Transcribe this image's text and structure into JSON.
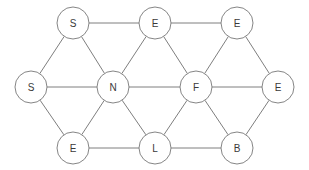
{
  "diagram": {
    "type": "graph",
    "canvas": {
      "width": 309,
      "height": 170
    },
    "style": {
      "background_color": "#ffffff",
      "node_fill": "#ffffff",
      "node_stroke": "#777777",
      "edge_stroke": "#6f6f6f",
      "label_color": "#3a3a3a",
      "node_radius": 16,
      "stroke_width": 0.9
    },
    "nodes": [
      {
        "id": "n0",
        "label": "S",
        "x": 73,
        "y": 23
      },
      {
        "id": "n1",
        "label": "E",
        "x": 155,
        "y": 23
      },
      {
        "id": "n2",
        "label": "E",
        "x": 237,
        "y": 23
      },
      {
        "id": "n3",
        "label": "S",
        "x": 31,
        "y": 87
      },
      {
        "id": "n4",
        "label": "N",
        "x": 113,
        "y": 87
      },
      {
        "id": "n5",
        "label": "F",
        "x": 196,
        "y": 87
      },
      {
        "id": "n6",
        "label": "E",
        "x": 278,
        "y": 87
      },
      {
        "id": "n7",
        "label": "E",
        "x": 73,
        "y": 148
      },
      {
        "id": "n8",
        "label": "L",
        "x": 155,
        "y": 148
      },
      {
        "id": "n9",
        "label": "B",
        "x": 237,
        "y": 148
      }
    ],
    "edges": [
      {
        "source": "n0",
        "target": "n1"
      },
      {
        "source": "n1",
        "target": "n2"
      },
      {
        "source": "n0",
        "target": "n3"
      },
      {
        "source": "n0",
        "target": "n4"
      },
      {
        "source": "n1",
        "target": "n4"
      },
      {
        "source": "n1",
        "target": "n5"
      },
      {
        "source": "n2",
        "target": "n5"
      },
      {
        "source": "n2",
        "target": "n6"
      },
      {
        "source": "n3",
        "target": "n4"
      },
      {
        "source": "n4",
        "target": "n5"
      },
      {
        "source": "n5",
        "target": "n6"
      },
      {
        "source": "n3",
        "target": "n7"
      },
      {
        "source": "n4",
        "target": "n7"
      },
      {
        "source": "n4",
        "target": "n8"
      },
      {
        "source": "n5",
        "target": "n8"
      },
      {
        "source": "n5",
        "target": "n9"
      },
      {
        "source": "n6",
        "target": "n9"
      },
      {
        "source": "n7",
        "target": "n8"
      },
      {
        "source": "n8",
        "target": "n9"
      }
    ]
  }
}
